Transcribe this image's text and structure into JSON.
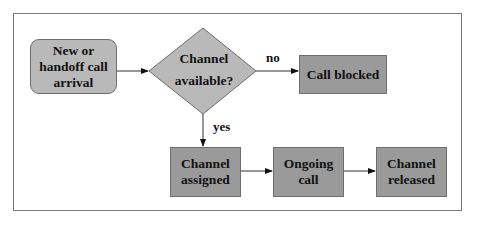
{
  "diagram": {
    "type": "flowchart",
    "nodes": {
      "arrival": {
        "label": "New or\nhandoff call\narrival",
        "shape": "rounded-rect"
      },
      "decision": {
        "label": "Channel\navailable?",
        "shape": "diamond"
      },
      "blocked": {
        "label": "Call blocked",
        "shape": "rect"
      },
      "assigned": {
        "label": "Channel\nassigned",
        "shape": "rect"
      },
      "ongoing": {
        "label": "Ongoing\ncall",
        "shape": "rect"
      },
      "released": {
        "label": "Channel\nreleased",
        "shape": "rect"
      }
    },
    "edges": [
      {
        "from": "arrival",
        "to": "decision",
        "label": ""
      },
      {
        "from": "decision",
        "to": "blocked",
        "label": "no"
      },
      {
        "from": "decision",
        "to": "assigned",
        "label": "yes"
      },
      {
        "from": "assigned",
        "to": "ongoing",
        "label": ""
      },
      {
        "from": "ongoing",
        "to": "released",
        "label": ""
      }
    ],
    "edge_labels": {
      "no": "no",
      "yes": "yes"
    },
    "colors": {
      "rect_fill": "#9a9a9a",
      "light_fill": "#b9b9b9",
      "stroke": "#6e6e6e",
      "frame": "#7a7a7a"
    }
  }
}
